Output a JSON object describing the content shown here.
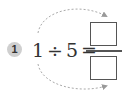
{
  "problem": {
    "number": "1",
    "dividend": "1",
    "operator": "÷",
    "divisor": "5",
    "equals": "=",
    "answer": {
      "numerator_box": "",
      "denominator_box": ""
    }
  },
  "arrows": [
    {
      "from": "dividend",
      "to": "numerator_box",
      "style": "dashed"
    },
    {
      "from": "dividend",
      "to": "denominator_box",
      "style": "dashed"
    }
  ],
  "colors": {
    "badge_fill": "#cfcfcf",
    "text": "#333333",
    "box_border": "#555555",
    "arrow": "#999999"
  }
}
